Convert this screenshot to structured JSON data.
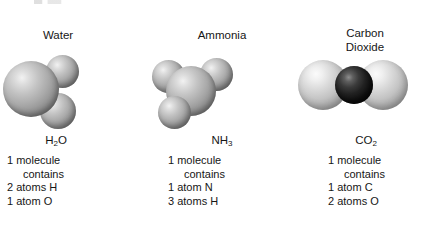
{
  "figure": {
    "background_color": "#ffffff",
    "text_color": "#161616",
    "molecules": [
      {
        "id": "water",
        "title": "Water",
        "formula_prefix": "H",
        "formula_sub": "2",
        "formula_suffix": "O",
        "formula_plain": "H2O",
        "caption": {
          "line1": "1 molecule",
          "line2": "contains",
          "line3": "2 atoms H",
          "line4": "1 atom O"
        },
        "atoms": [
          {
            "element": "O",
            "label": "oxygen-atom",
            "color": "#a9a9a9",
            "shade": "grey"
          },
          {
            "element": "H",
            "label": "hydrogen-atom",
            "color": "#a9a9a9",
            "shade": "grey"
          },
          {
            "element": "H",
            "label": "hydrogen-atom",
            "color": "#a9a9a9",
            "shade": "grey"
          }
        ]
      },
      {
        "id": "ammonia",
        "title": "Ammonia",
        "formula_prefix": "NH",
        "formula_sub": "3",
        "formula_suffix": "",
        "formula_plain": "NH3",
        "caption": {
          "line1": "1 molecule",
          "line2": "contains",
          "line3": "1 atom N",
          "line4": "3 atoms H"
        },
        "atoms": [
          {
            "element": "N",
            "label": "nitrogen-atom",
            "color": "#a9a9a9",
            "shade": "grey"
          },
          {
            "element": "H",
            "label": "hydrogen-atom",
            "color": "#a9a9a9",
            "shade": "grey"
          },
          {
            "element": "H",
            "label": "hydrogen-atom",
            "color": "#a9a9a9",
            "shade": "grey"
          },
          {
            "element": "H",
            "label": "hydrogen-atom",
            "color": "#a9a9a9",
            "shade": "grey"
          }
        ]
      },
      {
        "id": "carbon-dioxide",
        "title": "Carbon\nDioxide",
        "formula_prefix": "CO",
        "formula_sub": "2",
        "formula_suffix": "",
        "formula_plain": "CO2",
        "caption": {
          "line1": "1 molecule",
          "line2": "contains",
          "line3": "1 atom C",
          "line4": "2 atoms O"
        },
        "atoms": [
          {
            "element": "O",
            "label": "oxygen-atom",
            "color": "#c4c4c4",
            "shade": "grey-light"
          },
          {
            "element": "C",
            "label": "carbon-atom",
            "color": "#131313",
            "shade": "dark"
          },
          {
            "element": "O",
            "label": "oxygen-atom",
            "color": "#c4c4c4",
            "shade": "grey-light"
          }
        ]
      }
    ]
  }
}
